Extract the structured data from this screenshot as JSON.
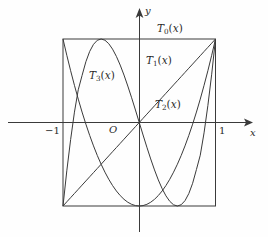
{
  "figure": {
    "background_color": "#fefefe",
    "line_color": "#3a3a3a",
    "text_color": "#2a2a2a"
  },
  "axes": {
    "x_axis_label": "x",
    "y_axis_label": "y",
    "origin_label": "O",
    "x_ticks": [
      {
        "value": -1,
        "label": "−1"
      },
      {
        "value": 1,
        "label": "1"
      }
    ]
  },
  "curve_labels": [
    {
      "name": "T0",
      "base": "T",
      "sub": "0",
      "arg": "(x)"
    },
    {
      "name": "T1",
      "base": "T",
      "sub": "1",
      "arg": "(x)"
    },
    {
      "name": "T2",
      "base": "T",
      "sub": "2",
      "arg": "(x)"
    },
    {
      "name": "T3",
      "base": "T",
      "sub": "3",
      "arg": "(x)"
    }
  ],
  "chart_data": {
    "type": "line",
    "title": "",
    "xlabel": "x",
    "ylabel": "y",
    "xlim": [
      -1,
      1
    ],
    "ylim": [
      -1,
      1
    ],
    "grid": false,
    "legend": "inline-annotations",
    "bounding_box": {
      "x": [
        -1,
        1
      ],
      "y": [
        -1,
        1
      ]
    },
    "x": [
      -1.0,
      -0.95,
      -0.9,
      -0.85,
      -0.8,
      -0.75,
      -0.7,
      -0.65,
      -0.6,
      -0.55,
      -0.5,
      -0.45,
      -0.4,
      -0.35,
      -0.3,
      -0.25,
      -0.2,
      -0.15,
      -0.1,
      -0.05,
      0.0,
      0.05,
      0.1,
      0.15,
      0.2,
      0.25,
      0.3,
      0.35,
      0.4,
      0.45,
      0.5,
      0.55,
      0.6,
      0.65,
      0.7,
      0.75,
      0.8,
      0.85,
      0.9,
      0.95,
      1.0
    ],
    "series": [
      {
        "name": "T0(x)",
        "formula": "1",
        "values": [
          1,
          1,
          1,
          1,
          1,
          1,
          1,
          1,
          1,
          1,
          1,
          1,
          1,
          1,
          1,
          1,
          1,
          1,
          1,
          1,
          1,
          1,
          1,
          1,
          1,
          1,
          1,
          1,
          1,
          1,
          1,
          1,
          1,
          1,
          1,
          1,
          1,
          1,
          1,
          1,
          1
        ]
      },
      {
        "name": "T1(x)",
        "formula": "x",
        "values": [
          -1.0,
          -0.95,
          -0.9,
          -0.85,
          -0.8,
          -0.75,
          -0.7,
          -0.65,
          -0.6,
          -0.55,
          -0.5,
          -0.45,
          -0.4,
          -0.35,
          -0.3,
          -0.25,
          -0.2,
          -0.15,
          -0.1,
          -0.05,
          0.0,
          0.05,
          0.1,
          0.15,
          0.2,
          0.25,
          0.3,
          0.35,
          0.4,
          0.45,
          0.5,
          0.55,
          0.6,
          0.65,
          0.7,
          0.75,
          0.8,
          0.85,
          0.9,
          0.95,
          1.0
        ]
      },
      {
        "name": "T2(x)",
        "formula": "2x^2 - 1",
        "values": [
          1.0,
          0.805,
          0.62,
          0.445,
          0.28,
          0.125,
          -0.02,
          -0.155,
          -0.28,
          -0.395,
          -0.5,
          -0.595,
          -0.68,
          -0.755,
          -0.82,
          -0.875,
          -0.92,
          -0.955,
          -0.98,
          -0.995,
          -1.0,
          -0.995,
          -0.98,
          -0.955,
          -0.92,
          -0.875,
          -0.82,
          -0.755,
          -0.68,
          -0.595,
          -0.5,
          -0.395,
          -0.28,
          -0.155,
          -0.02,
          0.125,
          0.28,
          0.445,
          0.62,
          0.805,
          1.0
        ]
      },
      {
        "name": "T3(x)",
        "formula": "4x^3 - 3x",
        "values": [
          -1.0,
          -0.5785,
          -0.204,
          0.1242,
          0.392,
          0.5625,
          0.728,
          0.8515,
          0.936,
          0.9845,
          1.0,
          0.9855,
          0.944,
          0.8785,
          0.792,
          0.6875,
          0.568,
          0.4365,
          0.296,
          0.1495,
          0.0,
          -0.1495,
          -0.296,
          -0.4365,
          -0.568,
          -0.6875,
          -0.792,
          -0.8785,
          -0.944,
          -0.9855,
          -1.0,
          -0.9845,
          -0.936,
          -0.8515,
          -0.728,
          -0.5625,
          -0.392,
          -0.1242,
          0.204,
          0.5785,
          1.0
        ]
      }
    ]
  }
}
